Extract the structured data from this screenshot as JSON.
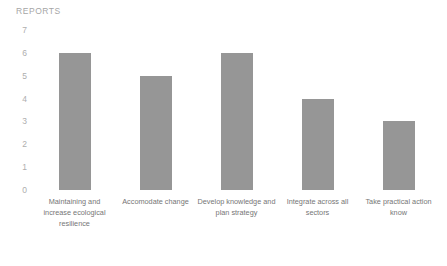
{
  "chart_data": {
    "type": "bar",
    "title": "REPORTS",
    "xlabel": "",
    "ylabel": "",
    "categories": [
      "Maintaining and increase ecological resilience",
      "Accomodate change",
      "Develop knowledge and plan strategy",
      "Integrate across all sectors",
      "Take practical action know"
    ],
    "values": [
      6,
      5,
      6,
      4,
      3
    ],
    "ylim": [
      0,
      7
    ],
    "ytick_labels": [
      "7",
      "6",
      "5",
      "4",
      "3",
      "2",
      "1",
      "0"
    ],
    "ytick_values": [
      7,
      6,
      5,
      4,
      3,
      2,
      1,
      0
    ],
    "grid": false,
    "legend": null,
    "bar_color": "#969696",
    "title_color": "#a6a6a6",
    "tick_label_color": "#aeaeae",
    "category_label_color": "#767676",
    "background_color": "#ffffff"
  }
}
